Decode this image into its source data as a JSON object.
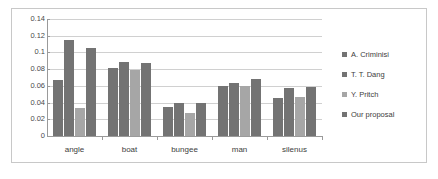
{
  "chart_data": {
    "type": "bar",
    "title": "",
    "subtitle": "",
    "xlabel": "",
    "ylabel": "",
    "categories": [
      "angle",
      "boat",
      "bungee",
      "man",
      "silenus"
    ],
    "series": [
      {
        "name": "A. Criminisi",
        "color": "#737373",
        "values": [
          0.067,
          0.081,
          0.035,
          0.06,
          0.045
        ]
      },
      {
        "name": "T. T. Dang",
        "color": "#737373",
        "values": [
          0.115,
          0.089,
          0.04,
          0.064,
          0.057
        ]
      },
      {
        "name": "Y. Pritch",
        "color": "#a6a6a6",
        "values": [
          0.033,
          0.079,
          0.028,
          0.06,
          0.047
        ]
      },
      {
        "name": "Our proposal",
        "color": "#737373",
        "values": [
          0.105,
          0.087,
          0.04,
          0.068,
          0.059
        ]
      }
    ],
    "ylim": [
      0,
      0.14
    ],
    "ytick_step": 0.02,
    "ytick_labels": [
      "0",
      "0.02",
      "0.04",
      "0.06",
      "0.08",
      "0.1",
      "0.12",
      "0.14"
    ],
    "grid": true,
    "legend_position": "right"
  }
}
